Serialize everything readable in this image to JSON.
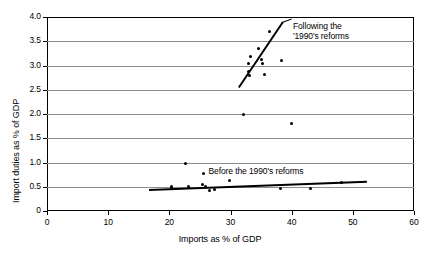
{
  "chart_data": {
    "type": "scatter",
    "title": "",
    "xlabel": "Imports as % of GDP",
    "ylabel": "Import duties as % of GDP",
    "xlim": [
      0,
      60
    ],
    "ylim": [
      0,
      4.0
    ],
    "xticks": [
      "0",
      "10",
      "20",
      "30",
      "40",
      "50",
      "60"
    ],
    "xtick_values": [
      0,
      10,
      20,
      30,
      40,
      50,
      60
    ],
    "yticks": [
      "0",
      "0.5",
      "1.0",
      "1.5",
      "2.0",
      "2.5",
      "3.0",
      "3.5",
      "4.0"
    ],
    "ytick_values": [
      0,
      0.5,
      1.0,
      1.5,
      2.0,
      2.5,
      3.0,
      3.5,
      4.0
    ],
    "grid": "horizontal",
    "legend": "none",
    "series": [
      {
        "name": "Following the 1990's reforms",
        "points": [
          [
            33.0,
            3.05
          ],
          [
            33.2,
            3.18
          ],
          [
            33.0,
            2.88
          ],
          [
            33.1,
            2.8
          ],
          [
            34.6,
            3.35
          ],
          [
            35.1,
            3.12
          ],
          [
            35.2,
            3.05
          ],
          [
            36.3,
            3.7
          ],
          [
            35.6,
            2.82
          ],
          [
            38.3,
            3.1
          ],
          [
            32.2,
            2.0
          ],
          [
            40.0,
            1.8
          ]
        ]
      },
      {
        "name": "Before the 1990's reforms",
        "points": [
          [
            20.3,
            0.5
          ],
          [
            20.4,
            0.46
          ],
          [
            22.6,
            0.98
          ],
          [
            23.2,
            0.5
          ],
          [
            25.6,
            0.78
          ],
          [
            25.4,
            0.55
          ],
          [
            25.9,
            0.5
          ],
          [
            26.6,
            0.43
          ],
          [
            27.4,
            0.45
          ],
          [
            29.9,
            0.62
          ],
          [
            38.2,
            0.47
          ],
          [
            43.0,
            0.47
          ],
          [
            48.2,
            0.58
          ]
        ]
      }
    ],
    "trendlines": [
      {
        "name": "Following the 1990's reforms",
        "x1": 31.3,
        "y1": 2.55,
        "x2": 38.5,
        "y2": 3.9
      },
      {
        "name": "Before the 1990's reforms",
        "x1": 16.7,
        "y1": 0.45,
        "x2": 52.3,
        "y2": 0.62
      }
    ],
    "annotations": [
      {
        "id": "following-reforms",
        "line1": "Following the",
        "line2": "'1990's reforms",
        "x": 40.2,
        "y": 3.88
      },
      {
        "id": "before-reforms",
        "text": "Before the 1990's reforms",
        "x": 26.4,
        "y": 0.8
      }
    ]
  }
}
